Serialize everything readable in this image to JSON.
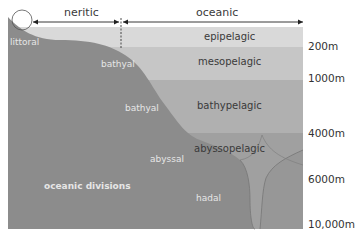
{
  "diagram": {
    "title": "oceanic divisions",
    "horizontal_zones": [
      {
        "label": "neritic"
      },
      {
        "label": "oceanic"
      }
    ],
    "pelagic_zones": [
      {
        "label": "epipelagic"
      },
      {
        "label": "mesopelagic"
      },
      {
        "label": "bathypelagic"
      },
      {
        "label": "abyssopelagic"
      }
    ],
    "benthic_zones": {
      "littoral": "littoral",
      "bathyal_upper": "bathyal",
      "bathyal_lower": "bathyal",
      "abyssal": "abyssal",
      "hadal": "hadal"
    },
    "depth_markers": [
      "200m",
      "1000m",
      "4000m",
      "6000m",
      "10,000m"
    ],
    "colors": {
      "epipelagic": "#d9d9d9",
      "mesopelagic": "#c6c6c6",
      "bathypelagic": "#b0b0b0",
      "abyssopelagic": "#9c9c9c",
      "seabed": "#8a8a8a",
      "seabed_stroke": "#707070",
      "arrow": "#222222",
      "sky": "#f2f2f2"
    }
  }
}
